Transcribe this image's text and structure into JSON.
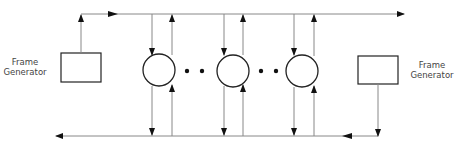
{
  "diagram": {
    "type": "ring-bus-block-diagram",
    "left_generator": {
      "label_line1": "Frame",
      "label_line2": "Generator"
    },
    "right_generator": {
      "label_line1": "Frame",
      "label_line2": "Generator"
    },
    "nodes": [
      {
        "id": "node-1",
        "shape": "circle"
      },
      {
        "id": "node-2",
        "shape": "circle"
      },
      {
        "id": "node-3",
        "shape": "circle"
      }
    ],
    "ellipsis": "• •",
    "top_bus_direction": "left-to-right",
    "bottom_bus_direction": "right-to-left",
    "colors": {
      "line": "#888888",
      "shape_stroke": "#222222",
      "arrow": "#111111"
    }
  }
}
